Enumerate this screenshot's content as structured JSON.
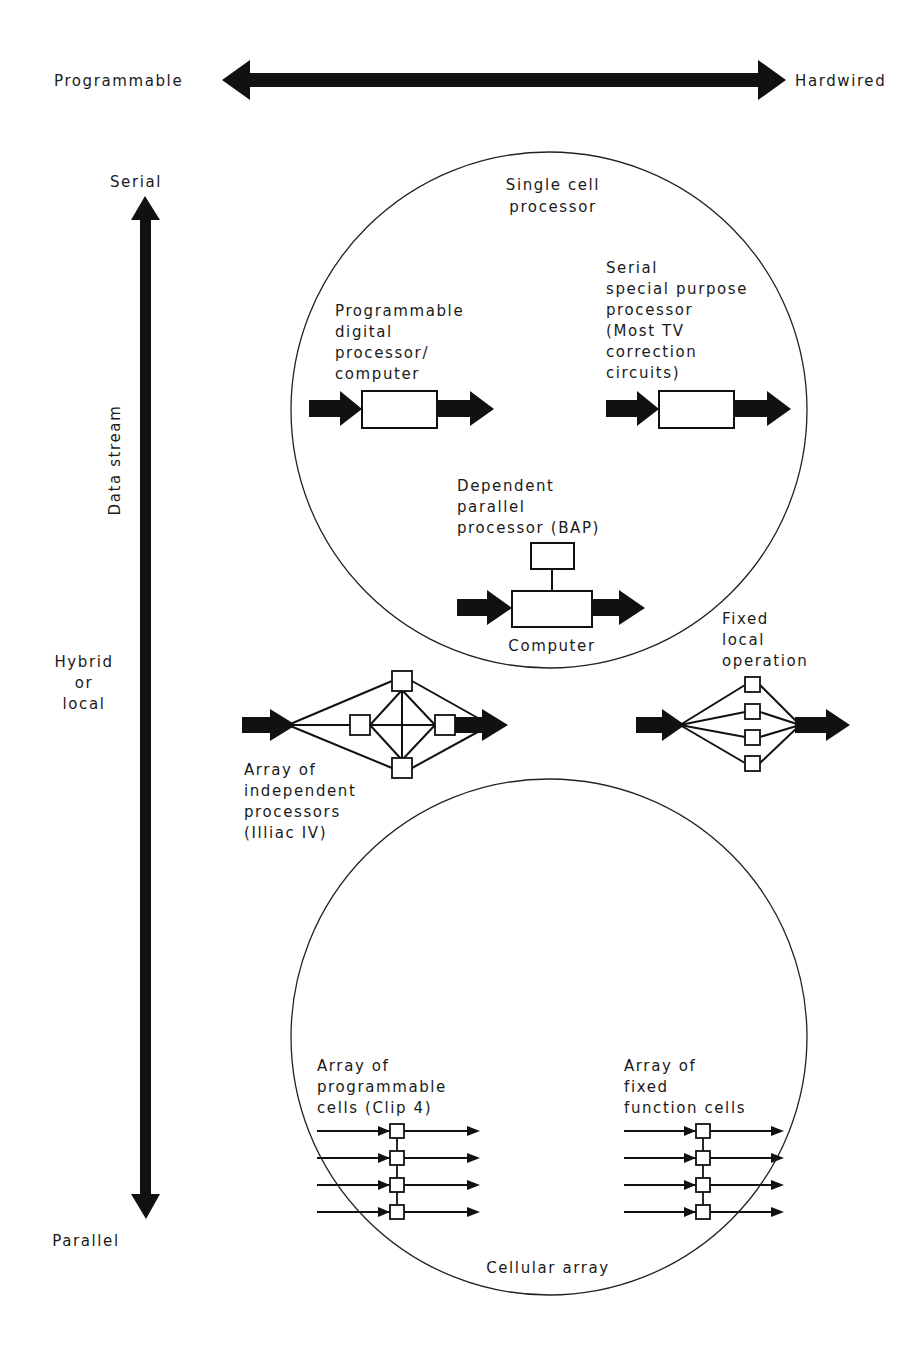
{
  "axes": {
    "horizontal": {
      "left_label": "Programmable",
      "right_label": "Hardwired"
    },
    "vertical": {
      "top_label": "Serial",
      "middle_label": [
        "Hybrid",
        "or",
        "local"
      ],
      "bottom_label": "Parallel",
      "axis_title": "Data stream"
    }
  },
  "groups": {
    "single_cell": {
      "title": [
        "Single cell",
        "processor"
      ]
    },
    "cellular": {
      "title": "Cellular array"
    }
  },
  "nodes": {
    "programmable_digital": {
      "label": [
        "Programmable",
        "digital",
        "processor/",
        "computer"
      ]
    },
    "serial_special": {
      "label": [
        "Serial",
        "special purpose",
        "processor",
        "(Most TV",
        "correction",
        "circuits)"
      ]
    },
    "dependent_parallel": {
      "label": [
        "Dependent",
        "parallel",
        "processor (BAP)"
      ],
      "sublabel": "Computer"
    },
    "array_independent": {
      "label": [
        "Array of",
        "independent",
        "processors",
        "(Illiac IV)"
      ]
    },
    "fixed_local": {
      "label": [
        "Fixed",
        "local",
        "operation"
      ]
    },
    "array_programmable_cells": {
      "label": [
        "Array of",
        "programmable",
        "cells (Clip 4)"
      ],
      "rows": 4
    },
    "array_fixed_cells": {
      "label": [
        "Array of",
        "fixed",
        "function cells"
      ],
      "rows": 4
    }
  }
}
